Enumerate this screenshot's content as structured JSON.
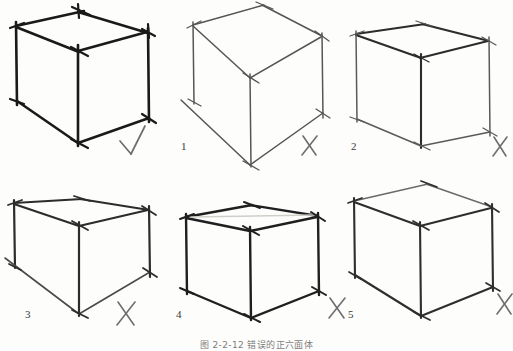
{
  "figure": {
    "caption": "图 2-2-12  错误的正六面体",
    "background_color": "#fdfdfc",
    "stroke_dark": "#1a1a1a",
    "stroke_mid": "#4a4a4a",
    "stroke_light": "#8a8a8a",
    "mark_color": "#6e6e6e",
    "total_cubes": 6,
    "rows": 2,
    "columns": 3
  },
  "cubes": [
    {
      "id": "cube-correct",
      "label": "",
      "mark": "✓",
      "mark_name": "check-mark",
      "verdict": "correct",
      "stroke_weight": "heavy",
      "stroke_color": "#1a1a1a",
      "note": "Correctly drawn cube with heavy confident strokes and overshooting vertices"
    },
    {
      "id": "cube-1",
      "label": "1",
      "mark": "✗",
      "mark_name": "cross-mark",
      "verdict": "incorrect",
      "stroke_weight": "light",
      "stroke_color": "#555555",
      "note": "Perspective too steep; front-bottom vertex drops too low"
    },
    {
      "id": "cube-2",
      "label": "2",
      "mark": "✗",
      "mark_name": "cross-mark",
      "verdict": "incorrect",
      "stroke_weight": "light",
      "stroke_color": "#5a5a5a",
      "note": "Vertical edges too long; top face too small"
    },
    {
      "id": "cube-3",
      "label": "3",
      "mark": "✗",
      "mark_name": "cross-mark",
      "verdict": "incorrect",
      "stroke_weight": "medium",
      "stroke_color": "#2c2c2c",
      "note": "Left vertical edge does not meet the bottom; base converges wrongly"
    },
    {
      "id": "cube-4",
      "label": "4",
      "mark": "✗",
      "mark_name": "cross-mark",
      "verdict": "incorrect",
      "stroke_weight": "heavy",
      "stroke_color": "#1f1f1f",
      "note": "Top face flattened almost to a line"
    },
    {
      "id": "cube-5",
      "label": "5",
      "mark": "✗",
      "mark_name": "cross-mark",
      "verdict": "incorrect",
      "stroke_weight": "medium",
      "stroke_color": "#2e2e2e",
      "note": "Top face skewed; back edge rises too far"
    }
  ],
  "labels": {
    "cube1": "1",
    "cube2": "2",
    "cube3": "3",
    "cube4": "4",
    "cube5": "5"
  }
}
